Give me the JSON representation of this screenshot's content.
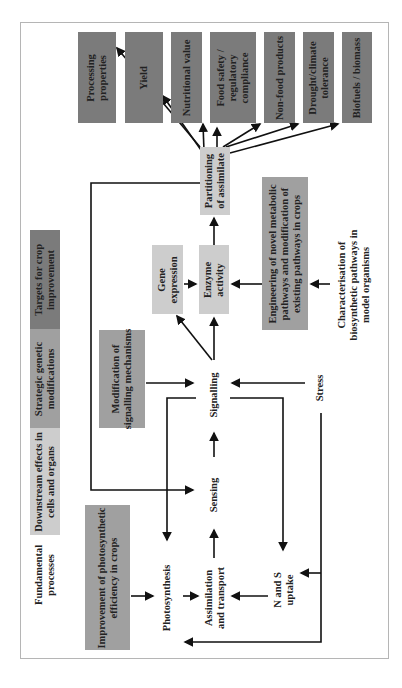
{
  "legend": {
    "targets": "Targets for crop improvement",
    "strategic": "Strategic genetic modifications",
    "downstream": "Downstream effects in cells and organs",
    "fundamental": "Fundamental processes"
  },
  "targets": [
    {
      "line1": "Processing",
      "line2": "properties"
    },
    {
      "line1": "Yield",
      "line2": ""
    },
    {
      "line1": "Nutritional value",
      "line2": ""
    },
    {
      "line1": "Food safety /",
      "line2": "regulatory",
      "line3": "compliance"
    },
    {
      "line1": "Non-food products",
      "line2": ""
    },
    {
      "line1": "Drought/climate",
      "line2": "tolerance"
    },
    {
      "line1": "Biofuels / biomass",
      "line2": ""
    }
  ],
  "downstream": {
    "partitioning": {
      "line1": "Partitioning",
      "line2": "of assimilate"
    },
    "gene_expression": {
      "line1": "Gene",
      "line2": "expression"
    },
    "enzyme_activity": {
      "line1": "Enzyme",
      "line2": "activity"
    }
  },
  "strategic": {
    "engineering": {
      "line1": "Engineering of novel metabolic",
      "line2": "pathways and modification of",
      "line3": "existing pathways in crops"
    },
    "signalling_mod": {
      "line1": "Modification of",
      "line2": "signalling mechanisms"
    },
    "photosynthetic": {
      "line1": "Improvement of photosynthetic",
      "line2": "efficiency in crops"
    }
  },
  "fundamental": {
    "characterisation": {
      "line1": "Characterisation of",
      "line2": "biosynthetic pathways in",
      "line3": "model organisms"
    },
    "signalling": "Signalling",
    "sensing": "Sensing",
    "stress": "Stress",
    "photosynthesis": "Photosynthesis",
    "assimilation": {
      "line1": "Assimilation",
      "line2": "and transport"
    },
    "ns_uptake": {
      "line1": "N and S",
      "line2": "uptake"
    }
  },
  "colors": {
    "dark": "#7b7b7b",
    "mid": "#a0a0a0",
    "light": "#cdcdcd",
    "line": "#111111",
    "frame": "#b5b5b5"
  }
}
